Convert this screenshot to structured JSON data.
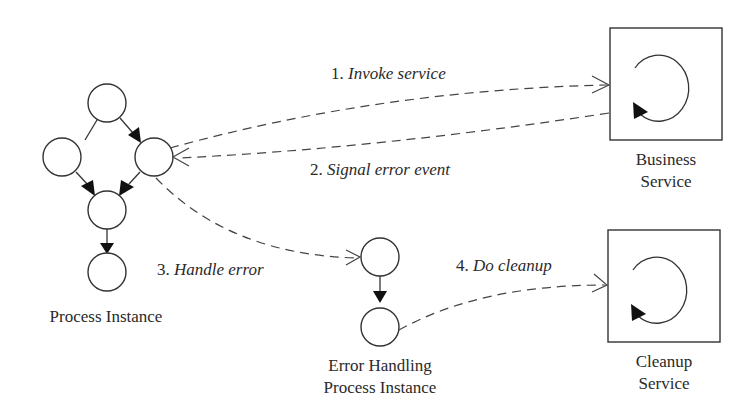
{
  "diagram": {
    "type": "process-error-handling-flow",
    "nodes": {
      "process_instance": {
        "label": "Process Instance",
        "activity_count": 5
      },
      "business_service": {
        "label_line1": "Business",
        "label_line2": "Service"
      },
      "error_handling_process": {
        "label_line1": "Error Handling",
        "label_line2": "Process Instance",
        "activity_count": 2
      },
      "cleanup_service": {
        "label_line1": "Cleanup",
        "label_line2": "Service"
      }
    },
    "edges": [
      {
        "id": "invoke",
        "num": "1.",
        "text": "Invoke service",
        "from": "process_instance",
        "to": "business_service",
        "style": "dashed"
      },
      {
        "id": "signal",
        "num": "2.",
        "text": "Signal error event",
        "from": "business_service",
        "to": "process_instance",
        "style": "dashed"
      },
      {
        "id": "handle",
        "num": "3.",
        "text": "Handle error",
        "from": "process_instance",
        "to": "error_handling_process",
        "style": "dashed"
      },
      {
        "id": "cleanup",
        "num": "4.",
        "text": "Do cleanup",
        "from": "error_handling_process",
        "to": "cleanup_service",
        "style": "dashed"
      }
    ],
    "colors": {
      "stroke": "#333333",
      "text": "#2a2a2a",
      "background": "#ffffff"
    }
  }
}
